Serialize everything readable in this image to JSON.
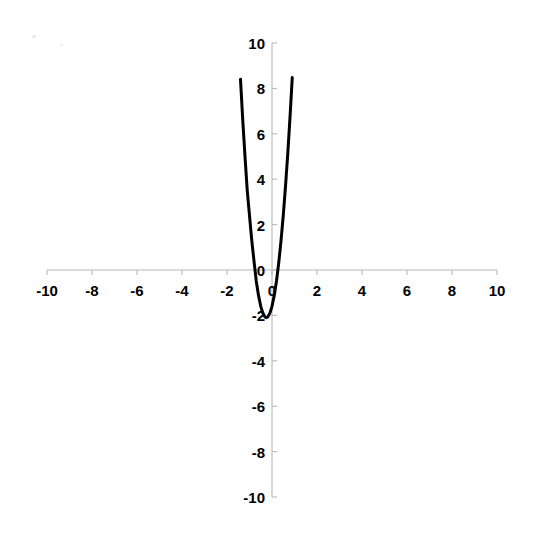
{
  "chart_data": {
    "type": "line",
    "title": "",
    "subtitle": "",
    "xlabel": "",
    "ylabel": "",
    "xlim": [
      -10,
      10
    ],
    "ylim": [
      -10,
      10
    ],
    "grid": false,
    "legend": null,
    "axes": {
      "x_ticks": [
        -10,
        -8,
        -6,
        -4,
        -2,
        0,
        2,
        4,
        6,
        8,
        10
      ],
      "x_tick_labels": [
        "-10",
        "-8",
        "-6",
        "-4",
        "-2",
        "0",
        "2",
        "4",
        "6",
        "8",
        "10"
      ],
      "y_ticks": [
        -10,
        -8,
        -6,
        -4,
        -2,
        0,
        2,
        4,
        6,
        8,
        10
      ],
      "y_tick_labels": [
        "-10",
        "-8",
        "-6",
        "-4",
        "-2",
        "0",
        "2",
        "4",
        "6",
        "8",
        "10"
      ],
      "axis_color": "#b8b8b8",
      "tick_label_color": "#000000"
    },
    "series": [
      {
        "name": "parabola",
        "color": "#000000",
        "line_width": 3,
        "equation": "y = 8x^2 + 4x - 1.6",
        "vertex": [
          -0.25,
          -2.1
        ],
        "roots": [
          -0.96,
          0.46
        ],
        "y_intercept": -1.6,
        "x": [
          -2.22,
          -2.1,
          -2.0,
          -1.9,
          -1.8,
          -1.7,
          -1.6,
          -1.5,
          -1.4,
          -1.3,
          -1.2,
          -1.1,
          -1.0,
          -0.9,
          -0.8,
          -0.7,
          -0.6,
          -0.5,
          -0.4,
          -0.3,
          -0.25,
          -0.2,
          -0.1,
          0.0,
          0.1,
          0.2,
          0.3,
          0.4,
          0.5,
          0.6,
          0.7,
          0.8,
          0.9,
          1.0,
          1.1,
          1.2,
          1.3,
          1.4,
          1.5,
          1.6,
          1.7,
          1.79
        ],
        "y": [
          29.0,
          25.3,
          22.4,
          19.7,
          17.1,
          14.7,
          12.5,
          10.4,
          8.4,
          6.6,
          5.0,
          3.5,
          2.4,
          1.3,
          0.4,
          -0.48,
          -1.12,
          -1.6,
          -1.92,
          -2.08,
          -2.1,
          -2.08,
          -1.92,
          -1.6,
          -1.12,
          -0.48,
          0.32,
          1.28,
          2.4,
          3.68,
          5.12,
          6.72,
          8.48,
          10.4,
          12.48,
          14.72,
          17.12,
          19.68,
          22.4,
          25.28,
          28.32,
          31.0
        ]
      }
    ],
    "annotations": []
  },
  "figure": {
    "background": "#ffffff",
    "width": 535,
    "height": 543
  }
}
